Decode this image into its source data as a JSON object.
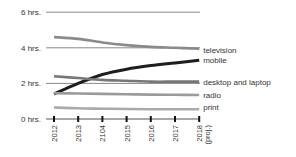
{
  "chart_data": {
    "type": "line",
    "title": "",
    "xlabel": "",
    "ylabel": "",
    "categories": [
      "2012",
      "2013",
      "2104",
      "2015",
      "2016",
      "2017",
      "2018 (proj.)"
    ],
    "x_tick_labels": [
      [
        "2012"
      ],
      [
        "2013"
      ],
      [
        "2104"
      ],
      [
        "2015"
      ],
      [
        "2016"
      ],
      [
        "2017"
      ],
      [
        "2018",
        "(proj.)"
      ]
    ],
    "y_ticks": [
      {
        "value": 0,
        "label": "0 hrs."
      },
      {
        "value": 2,
        "label": "2 hrs."
      },
      {
        "value": 4,
        "label": "4 hrs."
      },
      {
        "value": 6,
        "label": "6 hrs."
      }
    ],
    "ylim": [
      0,
      6
    ],
    "grid": true,
    "legend_position": "right-inline",
    "series": [
      {
        "name": "television",
        "color": "#8a8a8a",
        "values": [
          4.6,
          4.5,
          4.3,
          4.15,
          4.05,
          4.0,
          3.95
        ]
      },
      {
        "name": "mobile",
        "color": "#1e1e1e",
        "values": [
          1.4,
          2.0,
          2.5,
          2.8,
          3.0,
          3.15,
          3.3
        ]
      },
      {
        "name": "desktop and laptop",
        "color": "#777777",
        "values": [
          2.4,
          2.3,
          2.2,
          2.15,
          2.1,
          2.1,
          2.1
        ]
      },
      {
        "name": "radio",
        "color": "#9a9a9a",
        "values": [
          1.45,
          1.43,
          1.41,
          1.39,
          1.37,
          1.36,
          1.35
        ]
      },
      {
        "name": "print",
        "color": "#aaaaaa",
        "values": [
          0.65,
          0.6,
          0.58,
          0.56,
          0.55,
          0.55,
          0.55
        ]
      }
    ]
  }
}
